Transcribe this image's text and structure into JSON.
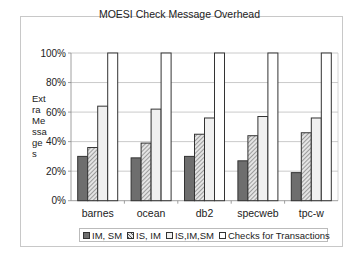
{
  "chart_data": {
    "type": "bar",
    "title": "MOESI Check Message Overhead",
    "xlabel": "",
    "ylabel": "Extra Messages",
    "ylabel_wrapped": [
      "Ext",
      "ra",
      "Me",
      "ssa",
      "ge",
      "s"
    ],
    "ylim": [
      0,
      100
    ],
    "yticks": [
      "0%",
      "20%",
      "40%",
      "60%",
      "80%",
      "100%"
    ],
    "grid": true,
    "legend_position": "bottom",
    "categories": [
      "barnes",
      "ocean",
      "db2",
      "specweb",
      "tpc-w"
    ],
    "series": [
      {
        "name": "IM, SM",
        "values": [
          30,
          29,
          30,
          27,
          19
        ],
        "color": "#6e6e6e",
        "pattern": "solid"
      },
      {
        "name": "IS, IM",
        "values": [
          36,
          39,
          45,
          44,
          46
        ],
        "color": "#d0d0d0",
        "pattern": "hatched"
      },
      {
        "name": "IS,IM,SM",
        "values": [
          64,
          62,
          56,
          57,
          56
        ],
        "color": "#f0f0f0",
        "pattern": "solid"
      },
      {
        "name": "Checks for Transactions",
        "values": [
          100,
          100,
          100,
          100,
          100
        ],
        "color": "#ffffff",
        "pattern": "solid"
      }
    ]
  }
}
